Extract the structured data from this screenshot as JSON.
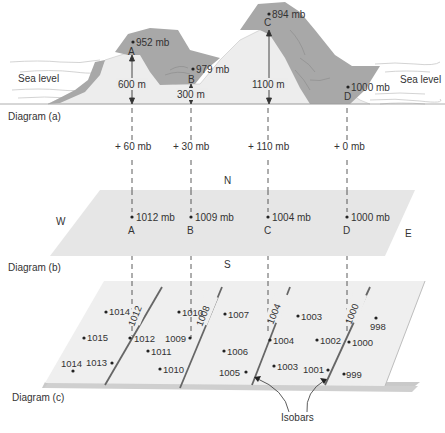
{
  "colors": {
    "mountain_light": "#ececec",
    "mountain_dark": "#a9a9a9",
    "plane_b": "#e6e6e6",
    "plane_c_top": "#efefef",
    "plane_c_edge": "#cfcfcf",
    "isobar": "#666666",
    "text": "#333333"
  },
  "diagram_a": {
    "label": "Diagram (a)",
    "sea_level_left": "Sea level",
    "sea_level_right": "Sea level",
    "stations": [
      {
        "id": "A",
        "pressure": "952 mb",
        "elevation": "600 m",
        "correction": "+ 60 mb"
      },
      {
        "id": "B",
        "pressure": "979 mb",
        "elevation": "300 m",
        "correction": "+ 30 mb"
      },
      {
        "id": "C",
        "pressure": "894 mb",
        "elevation": "1100 m",
        "correction": "+ 110 mb"
      },
      {
        "id": "D",
        "pressure": "1000 mb",
        "elevation": "",
        "correction": "+ 0 mb"
      }
    ]
  },
  "diagram_b": {
    "label": "Diagram (b)",
    "compass": {
      "n": "N",
      "s": "S",
      "w": "W",
      "e": "E"
    },
    "stations": [
      {
        "id": "A",
        "pressure": "1012 mb"
      },
      {
        "id": "B",
        "pressure": "1009 mb"
      },
      {
        "id": "C",
        "pressure": "1004 mb"
      },
      {
        "id": "D",
        "pressure": "1000 mb"
      }
    ]
  },
  "diagram_c": {
    "label": "Diagram (c)",
    "isobars_label": "Isobars",
    "isobar_values": [
      "1012",
      "1008",
      "1004",
      "1000"
    ],
    "points": [
      {
        "v": "1014"
      },
      {
        "v": "1015"
      },
      {
        "v": "1014"
      },
      {
        "v": "1013"
      },
      {
        "v": "1012"
      },
      {
        "v": "1011"
      },
      {
        "v": "1010"
      },
      {
        "v": "1010"
      },
      {
        "v": "1009"
      },
      {
        "v": "1007"
      },
      {
        "v": "1006"
      },
      {
        "v": "1005"
      },
      {
        "v": "1004"
      },
      {
        "v": "1003"
      },
      {
        "v": "1003"
      },
      {
        "v": "1002"
      },
      {
        "v": "1001"
      },
      {
        "v": "1000"
      },
      {
        "v": "998"
      },
      {
        "v": "999"
      }
    ]
  }
}
